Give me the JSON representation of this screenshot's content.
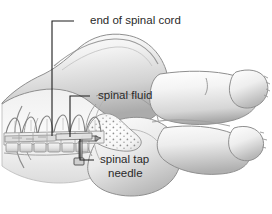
{
  "figure": {
    "background_color": "#ffffff",
    "line_color": "#1d1d1d",
    "text_color": "#2a2a2a",
    "body_fill_light": "#fbfbfb",
    "body_fill_mid": "#d8d8d8",
    "body_fill_dark": "#9a9a9a",
    "bone_fill": "#eeeeee"
  },
  "labels": [
    {
      "id": "end-of-spinal-cord",
      "text": "end of spinal cord",
      "text_x": 90,
      "text_y": 21,
      "leader": "M 74 21 L 52 21 L 52 136",
      "lines": [
        "end of spinal cord"
      ]
    },
    {
      "id": "spinal-fluid",
      "text": "spinal fluid",
      "text_x": 98,
      "text_y": 96,
      "leader": "M 90 96 L 70 96 L 70 137",
      "lines": [
        "spinal fluid"
      ]
    },
    {
      "id": "spinal-tap-needle",
      "text": "spinal tap needle",
      "text_x": 100,
      "text_y": 160,
      "leader": "M 94 160 L 80 160 L 80 139",
      "lines": [
        "spinal tap",
        "needle"
      ],
      "line1_x": 100,
      "line1_y": 160,
      "line2_x": 108,
      "line2_y": 174
    }
  ],
  "anatomy": {
    "regions": [
      {
        "id": "back-torso",
        "name": "curved back and shoulder"
      },
      {
        "id": "buttock",
        "name": "buttock and hip"
      },
      {
        "id": "upper-leg",
        "name": "upper leg and foot"
      },
      {
        "id": "lower-leg",
        "name": "lower leg and foot"
      },
      {
        "id": "vertebral-column",
        "name": "lumbar vertebrae with spinous processes"
      },
      {
        "id": "spinal-canal",
        "name": "spinal canal containing cord"
      },
      {
        "id": "cauda-equina",
        "name": "stippled spinal fluid sac"
      },
      {
        "id": "needle",
        "name": "spinal tap needle inserted between vertebrae"
      },
      {
        "id": "rib-arcs",
        "name": "rib / pelvic arcs"
      }
    ],
    "vertebra_count": 7,
    "needle_insertion_x": 80
  }
}
